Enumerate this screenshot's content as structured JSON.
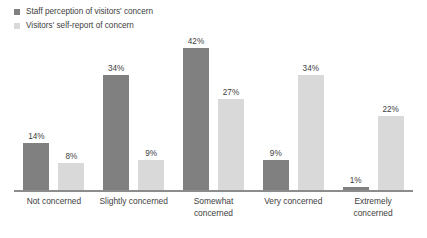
{
  "chart_data": {
    "type": "bar",
    "title": "",
    "subtitle": "",
    "xlabel": "",
    "ylabel": "",
    "ylim": [
      0,
      42
    ],
    "grid": false,
    "legend_position": "top-left",
    "orientation": "vertical",
    "grouping": "grouped",
    "value_suffix": "%",
    "categories": [
      "Not concerned",
      "Slightly concerned",
      "Somewhat concerned",
      "Very concerned",
      "Extremely concerned"
    ],
    "category_lines": [
      [
        "Not concerned"
      ],
      [
        "Slightly concerned"
      ],
      [
        "Somewhat",
        "concerned"
      ],
      [
        "Very concerned"
      ],
      [
        "Extremely",
        "concerned"
      ]
    ],
    "series": [
      {
        "name": "Staff perception of visitors' concern",
        "color": "#808080",
        "values": [
          14,
          34,
          42,
          9,
          1
        ],
        "labels": [
          "14%",
          "34%",
          "42%",
          "9%",
          "1%"
        ]
      },
      {
        "name": "Visitors' self-report of concern",
        "color": "#d9d9d9",
        "values": [
          8,
          9,
          27,
          34,
          22
        ],
        "labels": [
          "8%",
          "9%",
          "27%",
          "34%",
          "22%"
        ]
      }
    ]
  },
  "colors": {
    "series_1": "#808080",
    "series_2": "#d9d9d9",
    "axis": "#8c8c8c",
    "text": "#404040",
    "background": "#ffffff"
  },
  "legend": {
    "items": [
      {
        "label": "Staff perception of visitors' concern",
        "color": "#808080"
      },
      {
        "label": "Visitors' self-report of concern",
        "color": "#d9d9d9"
      }
    ]
  }
}
